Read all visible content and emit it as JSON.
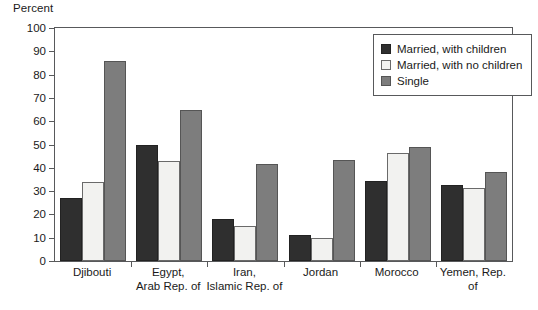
{
  "chart_data": {
    "type": "bar",
    "title": "",
    "xlabel": "",
    "ylabel": "Percent",
    "ylim": [
      0,
      100
    ],
    "ytick_step": 10,
    "yticks": [
      100,
      90,
      80,
      70,
      60,
      50,
      40,
      30,
      20,
      10,
      0
    ],
    "grid": false,
    "legend_position": "top-right",
    "categories": [
      "Djibouti",
      "Egypt,\nArab Rep. of",
      "Iran,\nIslamic Rep. of",
      "Jordan",
      "Morocco",
      "Yemen, Rep. of"
    ],
    "series": [
      {
        "name": "Married, with children",
        "color": "#2f2f2f",
        "values": [
          27,
          50,
          18,
          11,
          34.5,
          32.5
        ]
      },
      {
        "name": "Married, with no children",
        "color": "#f2f2f0",
        "values": [
          34,
          43,
          15,
          10,
          46.5,
          31.5
        ]
      },
      {
        "name": "Single",
        "color": "#7d7d7d",
        "values": [
          86,
          65,
          41.5,
          43.5,
          49,
          38
        ]
      }
    ]
  }
}
